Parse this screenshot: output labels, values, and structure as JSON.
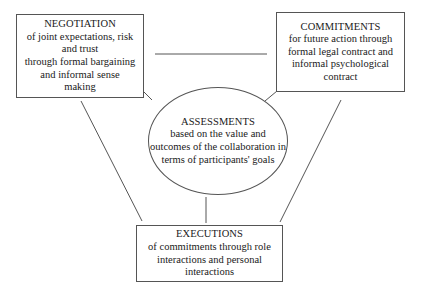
{
  "diagram": {
    "negotiation": {
      "title": "NEGOTIATION",
      "lines": [
        "of joint expectations, risk",
        "and trust",
        "through formal bargaining",
        "and informal sense",
        "making"
      ]
    },
    "commitments": {
      "title": "COMMITMENTS",
      "lines": [
        "for future action through",
        "formal legal contract and",
        "informal psychological",
        "contract"
      ]
    },
    "assessments": {
      "title": "ASSESSMENTS",
      "lines": [
        "based on the value and",
        "outcomes of the collaboration in",
        "terms of participants' goals"
      ]
    },
    "executions": {
      "title": "EXECUTIONS",
      "lines": [
        "of commitments through role",
        "interactions and personal",
        "interactions"
      ]
    },
    "line_color": "#555555"
  }
}
